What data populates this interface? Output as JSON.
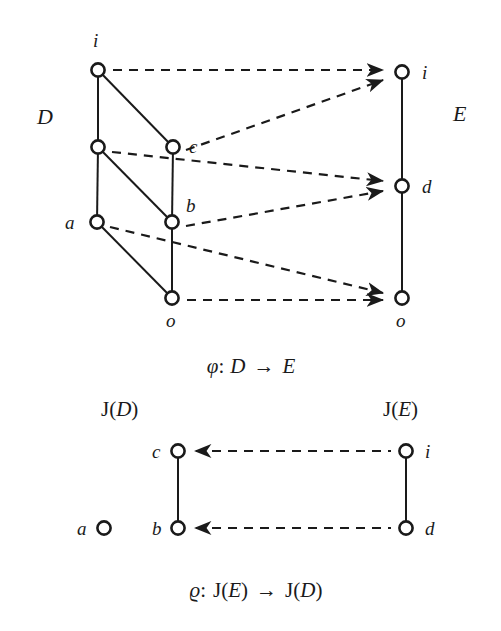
{
  "figure": {
    "background_color": "#ffffff",
    "ink_color": "#1a1a1a"
  },
  "top_diagram": {
    "left_poset_label": "D",
    "right_poset_label": "E",
    "left_nodes": [
      {
        "id": "i_D",
        "label": "i",
        "label_pos": "above",
        "x": 98,
        "y": 70
      },
      {
        "id": "mid_D",
        "label": "",
        "label_pos": "none",
        "x": 98,
        "y": 147
      },
      {
        "id": "c_D",
        "label": "c",
        "label_pos": "right",
        "x": 173,
        "y": 147
      },
      {
        "id": "a_D",
        "label": "a",
        "label_pos": "left",
        "x": 97,
        "y": 222
      },
      {
        "id": "b_D",
        "label": "b",
        "label_pos": "above-right",
        "x": 172,
        "y": 222
      },
      {
        "id": "o_D",
        "label": "o",
        "label_pos": "below",
        "x": 172,
        "y": 298
      }
    ],
    "left_edges": [
      {
        "from": "i_D",
        "to": "mid_D"
      },
      {
        "from": "i_D",
        "to": "c_D"
      },
      {
        "from": "mid_D",
        "to": "a_D"
      },
      {
        "from": "mid_D",
        "to": "b_D"
      },
      {
        "from": "c_D",
        "to": "b_D"
      },
      {
        "from": "a_D",
        "to": "o_D"
      },
      {
        "from": "b_D",
        "to": "o_D"
      }
    ],
    "right_nodes": [
      {
        "id": "i_E",
        "label": "i",
        "label_pos": "right",
        "x": 402,
        "y": 72
      },
      {
        "id": "d_E",
        "label": "d",
        "label_pos": "right",
        "x": 402,
        "y": 186
      },
      {
        "id": "o_E",
        "label": "o",
        "label_pos": "below",
        "x": 402,
        "y": 298
      }
    ],
    "right_edges": [
      {
        "from": "i_E",
        "to": "d_E"
      },
      {
        "from": "d_E",
        "to": "o_E"
      }
    ],
    "mappings": [
      {
        "from": "i_D",
        "to": "i_E",
        "style": "dashed-arrow"
      },
      {
        "from": "c_D",
        "to": "i_E",
        "style": "dashed-arrow"
      },
      {
        "from": "mid_D",
        "to": "d_E",
        "style": "dashed-arrow"
      },
      {
        "from": "b_D",
        "to": "d_E",
        "style": "dashed-arrow"
      },
      {
        "from": "a_D",
        "to": "o_E",
        "style": "dashed-arrow"
      },
      {
        "from": "o_D",
        "to": "o_E",
        "style": "dashed-arrow"
      }
    ],
    "caption": {
      "symbol": "φ",
      "colon": ":",
      "source": "D",
      "arrow": "→",
      "target": "E",
      "full_text": "φ: D → E"
    }
  },
  "bottom_diagram": {
    "left_poset_label": "J(D)",
    "left_poset_label_J": "J(",
    "left_poset_label_var": "D",
    "left_poset_label_close": ")",
    "right_poset_label": "J(E)",
    "right_poset_label_J": "J(",
    "right_poset_label_var": "E",
    "right_poset_label_close": ")",
    "left_nodes": [
      {
        "id": "c_JD",
        "label": "c",
        "label_pos": "left",
        "x": 178,
        "y": 451
      },
      {
        "id": "b_JD",
        "label": "b",
        "label_pos": "left",
        "x": 178,
        "y": 528
      },
      {
        "id": "a_JD",
        "label": "a",
        "label_pos": "left",
        "x": 104,
        "y": 528
      }
    ],
    "left_edges": [
      {
        "from": "c_JD",
        "to": "b_JD"
      }
    ],
    "right_nodes": [
      {
        "id": "i_JE",
        "label": "i",
        "label_pos": "right",
        "x": 406,
        "y": 451
      },
      {
        "id": "d_JE",
        "label": "d",
        "label_pos": "right",
        "x": 406,
        "y": 528
      }
    ],
    "right_edges": [
      {
        "from": "i_JE",
        "to": "d_JE"
      }
    ],
    "mappings": [
      {
        "from": "i_JE",
        "to": "c_JD",
        "style": "dashed-arrow-left"
      },
      {
        "from": "d_JE",
        "to": "b_JD",
        "style": "dashed-arrow-left"
      }
    ],
    "caption": {
      "symbol": "ϱ",
      "colon": ":",
      "source": "J(E)",
      "arrow": "→",
      "target": "J(D)",
      "full_text": "ϱ: J(E) → J(D)"
    }
  }
}
